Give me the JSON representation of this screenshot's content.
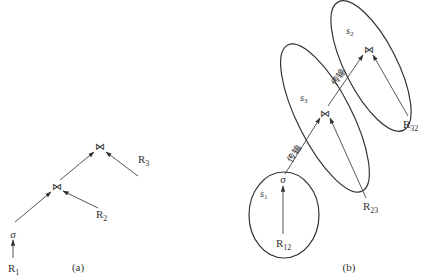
{
  "diagram_a": {
    "label": "(a)",
    "nodes": {
      "join_top": "⋈",
      "join_mid": "⋈",
      "select": "σ",
      "r1": "R",
      "r1_sub": "1",
      "r2": "R",
      "r2_sub": "2",
      "r3": "R",
      "r3_sub": "3"
    }
  },
  "diagram_b": {
    "label": "(b)",
    "sites": {
      "s1": "s",
      "s1_sub": "1",
      "s2": "s",
      "s2_sub": "2",
      "s3": "s",
      "s3_sub": "3"
    },
    "nodes": {
      "select": "σ",
      "join_s3": "⋈",
      "join_s2": "⋈",
      "r12": "R",
      "r12_sub": "12",
      "r23": "R",
      "r23_sub": "23",
      "r32": "R",
      "r32_sub": "32"
    },
    "edges": {
      "transfer_1": "传输",
      "transfer_2": "传输"
    }
  }
}
